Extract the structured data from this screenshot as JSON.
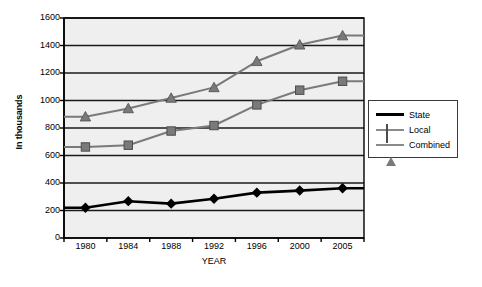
{
  "chart_data": {
    "type": "line",
    "title": "",
    "xlabel": "YEAR",
    "ylabel": "In thousands",
    "categories": [
      "1980",
      "1984",
      "1988",
      "1992",
      "1996",
      "2000",
      "2005"
    ],
    "ylim": [
      0,
      1600
    ],
    "yticks": [
      0,
      200,
      400,
      600,
      800,
      1000,
      1200,
      1400,
      1600
    ],
    "grid": true,
    "legend_position": "right",
    "series": [
      {
        "name": "State",
        "marker": "diamond",
        "color": "#000000",
        "values": [
          220,
          268,
          250,
          285,
          330,
          345,
          362
        ]
      },
      {
        "name": "Local",
        "marker": "square",
        "color": "#7a7a7a",
        "values": [
          662,
          675,
          778,
          818,
          968,
          1075,
          1140
        ]
      },
      {
        "name": "Combined",
        "marker": "triangle",
        "color": "#7a7a7a",
        "values": [
          882,
          942,
          1018,
          1095,
          1285,
          1405,
          1472
        ]
      }
    ]
  },
  "axes": {
    "y_title": "In thousands",
    "x_title": "YEAR"
  },
  "legend": {
    "entries": [
      {
        "label": "State"
      },
      {
        "label": "Local"
      },
      {
        "label": "Combined"
      }
    ]
  },
  "colors": {
    "plot_background": "#efefef",
    "grid": "#1a1a1a",
    "axis": "#000000",
    "state": "#000000",
    "local": "#7a7a7a",
    "combined": "#7a7a7a"
  }
}
